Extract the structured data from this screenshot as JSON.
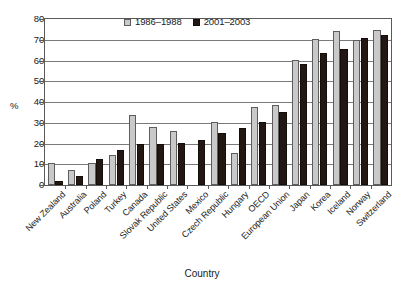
{
  "chart_data": {
    "type": "bar",
    "title": "",
    "xlabel": "Country",
    "ylabel": "%",
    "ylim": [
      0,
      80
    ],
    "yticks": [
      0,
      10,
      20,
      30,
      40,
      50,
      60,
      70,
      80
    ],
    "grid": true,
    "legend_position": "top-center",
    "categories": [
      "New Zealand",
      "Australia",
      "Poland",
      "Turkey",
      "Canada",
      "Slovak Republic",
      "United States",
      "Mexico",
      "Czech Republic",
      "Hungary",
      "OECD",
      "European Union",
      "Japan",
      "Korea",
      "Iceland",
      "Norway",
      "Switzerland"
    ],
    "series": [
      {
        "name": "1986–1988",
        "color": "#c9c9c9",
        "values": [
          10.6,
          7.3,
          10.4,
          14.3,
          33.9,
          27.8,
          25.8,
          null,
          30.3,
          15.5,
          37.5,
          38.8,
          60.1,
          70.3,
          74.0,
          69.7,
          74.6
        ]
      },
      {
        "name": "2001–2003",
        "color": "#231713",
        "values": [
          1.8,
          4.3,
          12.3,
          17.0,
          19.6,
          19.6,
          20.3,
          21.5,
          25.2,
          27.7,
          30.3,
          35.4,
          58.3,
          63.5,
          65.5,
          70.8,
          72.4
        ]
      }
    ]
  },
  "axes": {
    "y_title": "%",
    "x_title": "Country",
    "y_tick_labels": [
      "80",
      "70",
      "60",
      "50",
      "40",
      "30",
      "20",
      "10",
      "0"
    ]
  },
  "legend": {
    "items": [
      {
        "label": "1986–1988",
        "swatch": "legend-swatch-gray"
      },
      {
        "label": "2001–2003",
        "swatch": "legend-swatch-black"
      }
    ]
  }
}
